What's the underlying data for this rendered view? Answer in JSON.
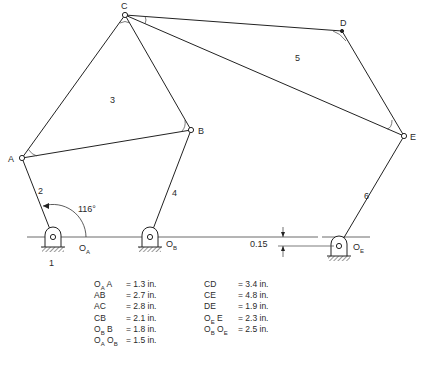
{
  "diagram": {
    "type": "mechanism-linkage",
    "points": {
      "A": {
        "label": "A"
      },
      "B": {
        "label": "B"
      },
      "C": {
        "label": "C"
      },
      "D": {
        "label": "D"
      },
      "E": {
        "label": "E"
      },
      "OA": {
        "label": "O",
        "sub": "A"
      },
      "OB": {
        "label": "O",
        "sub": "B"
      },
      "OE": {
        "label": "O",
        "sub": "E"
      }
    },
    "link_numbers": {
      "ground": "1",
      "crank": "2",
      "triangle_ABC": "3",
      "rocker_OBB": "4",
      "triangle_CDE": "5",
      "rocker_OEE": "6"
    },
    "angle_label": "116°",
    "offset_label": "0.15"
  },
  "dimensions": {
    "left": [
      {
        "key_main": "O",
        "key_sub": "A",
        "key_tail": " A",
        "value": "= 1.3 in."
      },
      {
        "key_main": "AB",
        "key_sub": "",
        "key_tail": "",
        "value": "= 2.7 in."
      },
      {
        "key_main": "AC",
        "key_sub": "",
        "key_tail": "",
        "value": "= 2.8 in."
      },
      {
        "key_main": "CB",
        "key_sub": "",
        "key_tail": "",
        "value": "= 2.1 in."
      },
      {
        "key_main": "O",
        "key_sub": "B",
        "key_tail": " B",
        "value": "= 1.8 in."
      },
      {
        "key_main": "O",
        "key_sub": "A",
        "key_tail": " O",
        "key_sub2": "B",
        "value": "= 1.5 in."
      }
    ],
    "right": [
      {
        "key_main": "CD",
        "key_sub": "",
        "key_tail": "",
        "value": "= 3.4 in."
      },
      {
        "key_main": "CE",
        "key_sub": "",
        "key_tail": "",
        "value": "= 4.8 in."
      },
      {
        "key_main": "DE",
        "key_sub": "",
        "key_tail": "",
        "value": "= 1.9 in."
      },
      {
        "key_main": "O",
        "key_sub": "E",
        "key_tail": " E",
        "value": "= 2.3 in."
      },
      {
        "key_main": "O",
        "key_sub": "B",
        "key_tail": " O",
        "key_sub2": "E",
        "value": "= 2.5 in."
      }
    ]
  }
}
